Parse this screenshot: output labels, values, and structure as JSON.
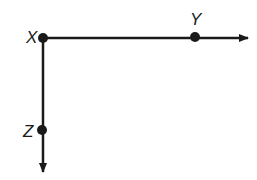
{
  "diagram": {
    "type": "ray-diagram",
    "stroke_color": "#1a1a1a",
    "background": "#ffffff",
    "points": [
      {
        "id": "X",
        "label": "X",
        "x": 43,
        "y": 38,
        "label_x": 26,
        "label_y": 43
      },
      {
        "id": "Y",
        "label": "Y",
        "x": 195,
        "y": 37,
        "label_x": 190,
        "label_y": 25
      },
      {
        "id": "Z",
        "label": "Z",
        "x": 42,
        "y": 130,
        "label_x": 23,
        "label_y": 137
      }
    ],
    "rays": [
      {
        "id": "ray-XY",
        "from": "X",
        "through": "Y",
        "direction": "right",
        "end_x": 248,
        "end_y": 38
      },
      {
        "id": "ray-XZ",
        "from": "X",
        "through": "Z",
        "direction": "down",
        "end_x": 43,
        "end_y": 172
      }
    ]
  }
}
